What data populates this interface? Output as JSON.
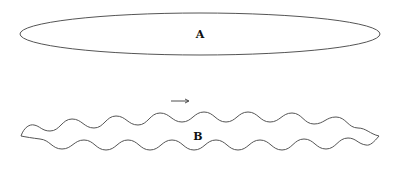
{
  "diagram": {
    "shape_a": {
      "label": "A",
      "type": "ellipse"
    },
    "shape_b": {
      "label": "B",
      "type": "wavy-band"
    },
    "arrow": {
      "direction": "right",
      "symbol": "→"
    },
    "stroke_color": "#555555",
    "background": "#ffffff"
  }
}
